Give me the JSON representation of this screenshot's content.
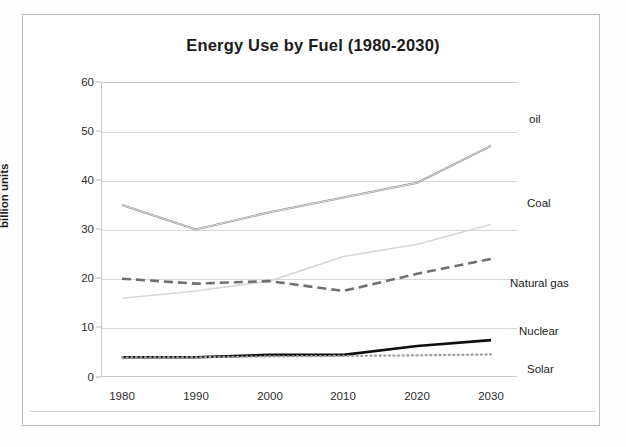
{
  "page": {
    "title": "Energy Use by Fuel (1980-2030)"
  },
  "chart_data": {
    "type": "line",
    "title": "Energy Use by Fuel (1980-2030)",
    "xlabel": "",
    "ylabel": "billion units",
    "categories": [
      "1980",
      "1990",
      "2000",
      "2010",
      "2020",
      "2030"
    ],
    "x": [
      1980,
      1990,
      2000,
      2010,
      2020,
      2030
    ],
    "ylim": [
      0,
      60
    ],
    "yticks": [
      "0",
      "10",
      "20",
      "30",
      "40",
      "50",
      "60"
    ],
    "grid": true,
    "legend": "inline-right-labels",
    "series": [
      {
        "name": "oil",
        "values": [
          35,
          30,
          33.5,
          36.5,
          39.5,
          47
        ],
        "style": "solid-thin-double",
        "color": "#8a8d8f",
        "label_position": "top-right"
      },
      {
        "name": "Coal",
        "values": [
          16,
          17.5,
          19.5,
          24.5,
          27,
          31
        ],
        "style": "solid-light",
        "color": "#d5d7d8",
        "label_position": "right"
      },
      {
        "name": "Natural gas",
        "values": [
          20,
          19,
          19.5,
          17.5,
          21,
          24
        ],
        "style": "dashed",
        "color": "#6e7173",
        "label_position": "right"
      },
      {
        "name": "Nuclear",
        "values": [
          4,
          4,
          4.5,
          4.5,
          6.3,
          7.5
        ],
        "style": "solid-thick-black",
        "color": "#0d0d0d",
        "label_position": "right"
      },
      {
        "name": "Solar",
        "values": [
          4,
          4,
          4.2,
          4.3,
          4.4,
          4.6
        ],
        "style": "dotted",
        "color": "#9a9c9d",
        "label_position": "right"
      }
    ]
  },
  "colors": {
    "background": "#ffffff",
    "frame": "#b9bcbd",
    "grid": "#d4d6d7",
    "text": "#1b1b1b"
  }
}
